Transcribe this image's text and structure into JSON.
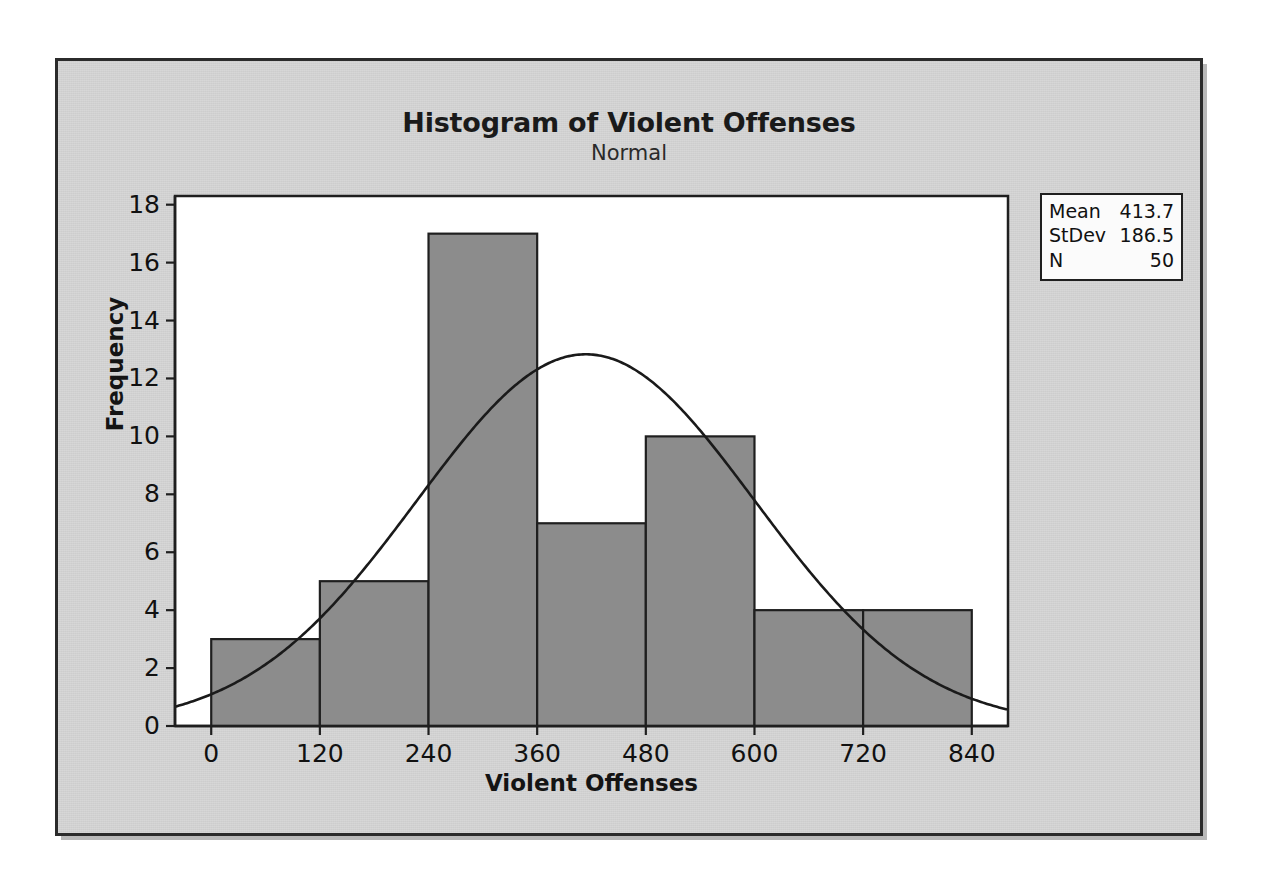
{
  "chart_data": {
    "type": "bar",
    "title": "Histogram of Violent Offenses",
    "subtitle": "Normal",
    "xlabel": "Violent Offenses",
    "ylabel": "Frequency",
    "xlim": [
      -40,
      880
    ],
    "ylim": [
      0,
      18.3
    ],
    "grid": false,
    "bin_width": 120,
    "bin_edges": [
      0,
      120,
      240,
      360,
      480,
      600,
      720,
      840
    ],
    "categories": [
      "0-120",
      "120-240",
      "240-360",
      "360-480",
      "480-600",
      "600-720",
      "720-840"
    ],
    "values": [
      3,
      5,
      17,
      7,
      10,
      4,
      4
    ],
    "x_ticks": [
      0,
      120,
      240,
      360,
      480,
      600,
      720,
      840
    ],
    "y_ticks": [
      0,
      2,
      4,
      6,
      8,
      10,
      12,
      14,
      16,
      18
    ],
    "overlay": {
      "name": "Normal",
      "type": "line",
      "distribution": "normal",
      "mean": 413.7,
      "stdev": 186.5,
      "n": 50,
      "scale_bin_width": 120,
      "peak_value": 12.85
    },
    "colors": {
      "bar_fill": "#8c8c8c",
      "bar_edge": "#1f1f1f",
      "curve": "#1a1a1a",
      "plot_background": "#ffffff",
      "panel_background": "#d4d4d4",
      "frame": "#2b2b2b",
      "text": "#111111"
    }
  },
  "stats_legend": {
    "rows": [
      {
        "label": "Mean",
        "value": "413.7"
      },
      {
        "label": "StDev",
        "value": "186.5"
      },
      {
        "label": "N",
        "value": "50"
      }
    ]
  }
}
